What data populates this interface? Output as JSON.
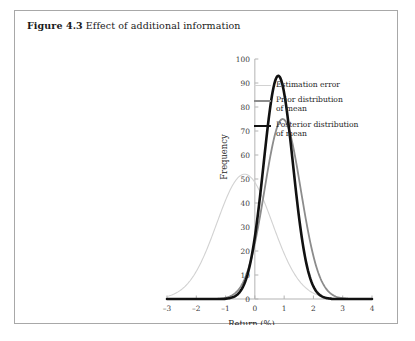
{
  "figure": {
    "number": "Figure 4.3",
    "title": "Effect of additional information"
  },
  "colors": {
    "estimation_error": "#d2d2d2",
    "prior": "#8c8c8c",
    "posterior": "#111111",
    "axis": "#b3b3b3",
    "border": "#a8a8a8",
    "text": "#1a1a1a"
  },
  "legend": {
    "position": "right",
    "items": [
      {
        "label": "Estimation error",
        "color": "#d2d2d2",
        "width": 1.1
      },
      {
        "label": "Prior distribution\nof mean",
        "color": "#8c8c8c",
        "width": 1.8
      },
      {
        "label": "Posterior distribution\nof mean",
        "color": "#111111",
        "width": 2.6
      }
    ]
  },
  "chart_data": {
    "type": "line",
    "title": "Effect of additional information",
    "xlabel": "Return (%)",
    "ylabel": "Frequency",
    "xlim": [
      -3,
      4
    ],
    "ylim": [
      0,
      100
    ],
    "xticks": [
      -3,
      -2,
      -1,
      0,
      1,
      2,
      3,
      4
    ],
    "xtick_labels": [
      "–3",
      "–2",
      "–1",
      "0",
      "1",
      "2",
      "3",
      "4"
    ],
    "yticks": [
      0,
      10,
      20,
      30,
      40,
      50,
      60,
      70,
      80,
      90,
      100
    ],
    "ytick_labels": [
      "0",
      "10",
      "20",
      "30",
      "40",
      "50",
      "60",
      "70",
      "80",
      "90",
      "100"
    ],
    "grid": false,
    "series": [
      {
        "name": "Estimation error",
        "color": "#d2d2d2",
        "line_width": 1.1,
        "distribution": "normal",
        "mean": -0.35,
        "sigma": 0.95,
        "peak": 52,
        "x": [
          -2.6,
          -2.2,
          -1.8,
          -1.4,
          -1.0,
          -0.6,
          -0.35,
          0.0,
          0.4,
          0.8,
          1.2,
          1.6,
          2.0,
          2.4,
          2.8
        ],
        "y": [
          1,
          3,
          8,
          17,
          31,
          46,
          52,
          47,
          35,
          22,
          11,
          5,
          2,
          1,
          0
        ]
      },
      {
        "name": "Prior distribution of mean",
        "color": "#8c8c8c",
        "line_width": 1.8,
        "distribution": "normal",
        "mean": 0.95,
        "sigma": 0.62,
        "peak": 75,
        "x": [
          -1.0,
          -0.6,
          -0.2,
          0.2,
          0.6,
          0.95,
          1.3,
          1.7,
          2.1,
          2.5,
          2.9
        ],
        "y": [
          0,
          1,
          5,
          22,
          55,
          75,
          60,
          29,
          8,
          2,
          0
        ]
      },
      {
        "name": "Posterior distribution of mean",
        "color": "#111111",
        "line_width": 2.6,
        "distribution": "normal",
        "mean": 0.8,
        "sigma": 0.5,
        "peak": 93,
        "x": [
          -1.0,
          -0.6,
          -0.2,
          0.2,
          0.5,
          0.8,
          1.1,
          1.5,
          1.9,
          2.3,
          2.7
        ],
        "y": [
          0,
          1,
          7,
          37,
          72,
          93,
          78,
          33,
          8,
          1,
          0
        ]
      }
    ]
  }
}
